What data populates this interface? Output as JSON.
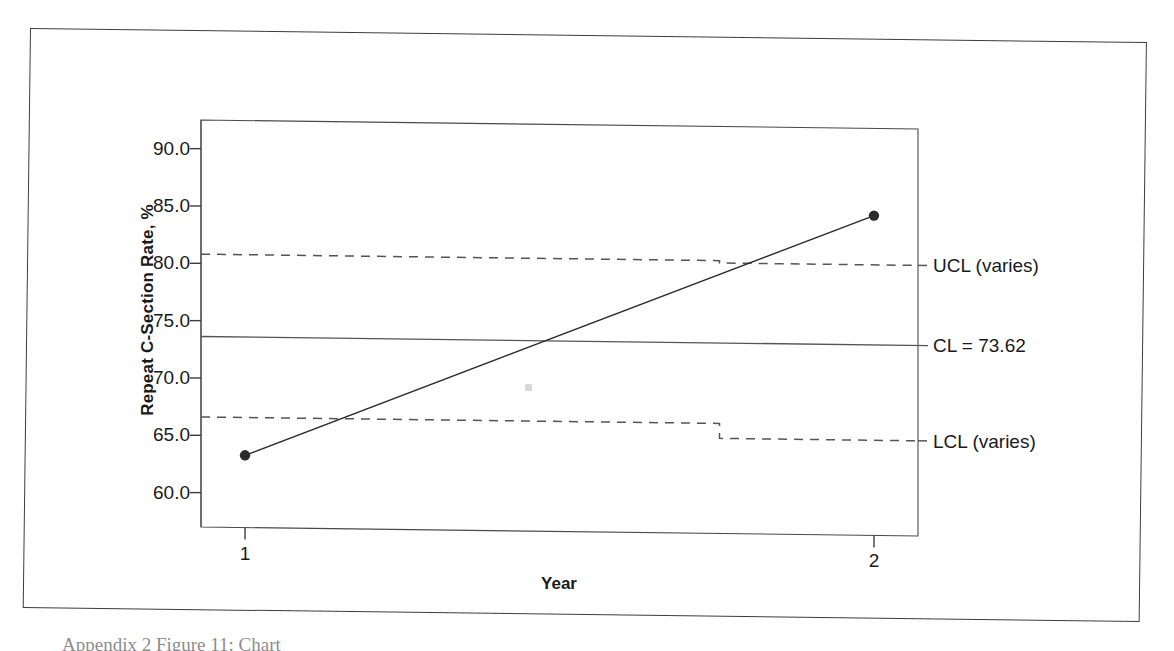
{
  "figure": {
    "caption": "Appendix 2 Figure 11:  Chart",
    "border_color": "#3d3d3d"
  },
  "chart_data": {
    "type": "line",
    "chart_kind": "statistical-process-control-chart",
    "title": "",
    "xlabel": "Year",
    "ylabel": "Repeat C-Section Rate, %",
    "x": [
      1,
      2
    ],
    "x_tick_labels": [
      "1",
      "2"
    ],
    "values": [
      63.3,
      84.9
    ],
    "series": [
      {
        "name": "Repeat C-Section Rate",
        "values": [
          63.3,
          84.9
        ]
      }
    ],
    "y_ticks": [
      60.0,
      65.0,
      70.0,
      75.0,
      80.0,
      85.0,
      90.0
    ],
    "y_tick_labels": [
      "60.0",
      "65.0",
      "70.0",
      "75.0",
      "80.0",
      "85.0",
      "90.0"
    ],
    "ylim": [
      57.0,
      92.5
    ],
    "xlim": [
      0.93,
      2.07
    ],
    "grid": false,
    "legend": "right-of-plot-inline",
    "center_line": {
      "label": "CL = 73.62",
      "value": 73.62,
      "style": "solid"
    },
    "upper_control_limit": {
      "label": "UCL (varies)",
      "style": "dashed",
      "varies": true,
      "values": [
        80.8,
        80.6
      ]
    },
    "lower_control_limit": {
      "label": "LCL (varies)",
      "style": "dashed",
      "varies": true,
      "values": [
        66.6,
        65.3
      ]
    },
    "marker": "filled-circle",
    "line_color": "#2b2b2b",
    "limit_color": "#555555"
  }
}
